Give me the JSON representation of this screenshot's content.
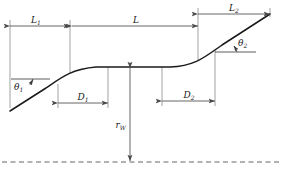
{
  "figure": {
    "type": "engineering-profile-diagram",
    "colors": {
      "profile_curve": "#1a1a1a",
      "dimension_line": "#555555",
      "extension_line": "#777777",
      "centerline": "#666666",
      "label_text": "#1a1a1a",
      "background": "#ffffff"
    }
  },
  "labels": {
    "length_1": {
      "base": "L",
      "sub": "1"
    },
    "length_total": {
      "base": "L",
      "sub": ""
    },
    "length_2": {
      "base": "L",
      "sub": "2"
    },
    "drop_1": {
      "base": "D",
      "sub": "1"
    },
    "drop_2": {
      "base": "D",
      "sub": "2"
    },
    "angle_1": {
      "base": "θ",
      "sub": "1"
    },
    "angle_2": {
      "base": "θ",
      "sub": "2"
    },
    "radius_w": {
      "base": "r",
      "sub": "W"
    }
  },
  "geometry": {
    "profile_path": "M 10,111 L 46,88 C 62,77 72,69 96,67 L 170,67 C 196,66 206,56 222,45 L 270,14",
    "centerline_y": 162,
    "plateau_y": 67,
    "dimensions": [
      {
        "name": "L1",
        "y": 26,
        "x_start": 10,
        "x_end": 70
      },
      {
        "name": "L",
        "y": 26,
        "x_start": 72,
        "x_end": 198
      },
      {
        "name": "L2",
        "y": 14,
        "x_start": 198,
        "x_end": 270
      },
      {
        "name": "D1",
        "y": 103,
        "x_start": 58,
        "x_end": 108
      },
      {
        "name": "D2",
        "y": 101,
        "x_start": 162,
        "x_end": 215
      },
      {
        "name": "rW",
        "x": 130,
        "y_top": 68,
        "y_bottom": 161
      }
    ]
  }
}
